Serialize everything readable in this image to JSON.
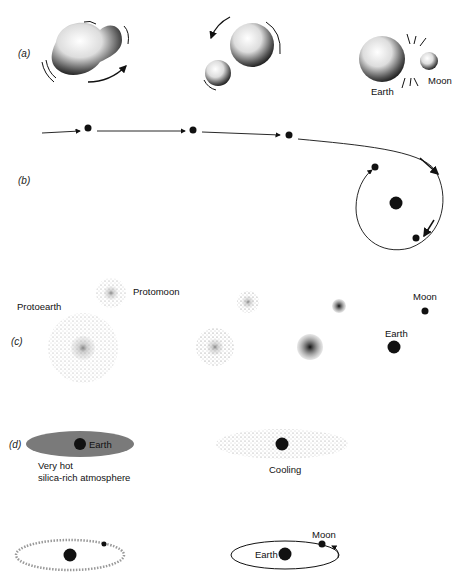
{
  "figure": {
    "panels": [
      {
        "id": "a",
        "label": "(a)",
        "theme": "fission",
        "labels": {
          "earth": "Earth",
          "moon": "Moon"
        }
      },
      {
        "id": "b",
        "label": "(b)",
        "theme": "capture"
      },
      {
        "id": "c",
        "label": "(c)",
        "theme": "co-accretion",
        "labels": {
          "protoearth": "Protoearth",
          "protomoon": "Protomoon",
          "earth": "Earth",
          "moon": "Moon"
        }
      },
      {
        "id": "d",
        "label": "(d)",
        "theme": "giant impact / vapor",
        "labels": {
          "earth": "Earth",
          "atmosphere_line1": "Very hot",
          "atmosphere_line2": "silica-rich atmosphere",
          "cooling": "Cooling",
          "earth2": "Earth",
          "moon2": "Moon"
        }
      }
    ],
    "colors": {
      "ink": "#111111",
      "atmosphere": "#7a7a7a",
      "dots": "#555555"
    }
  }
}
